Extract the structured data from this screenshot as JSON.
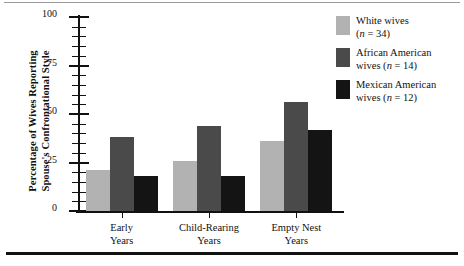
{
  "chart_data": {
    "type": "bar",
    "title": "",
    "xlabel": "",
    "ylabel": "Percentage of Wives Reporting Spouse's Confrontational Style",
    "ylabel_line1": "Percentage of Wives Reporting",
    "ylabel_line2": "Spouse's Confrontational Style",
    "ylim": [
      0,
      100
    ],
    "ytick_labels": [
      "0",
      "25",
      "50",
      "75",
      "100"
    ],
    "ytick_values": [
      0,
      25,
      50,
      75,
      100
    ],
    "yminor_step": 5,
    "grid": false,
    "legend_position": "top-right",
    "categories": [
      "Early Years",
      "Child-Rearing Years",
      "Empty Nest Years"
    ],
    "category_lines": [
      [
        "Early",
        "Years"
      ],
      [
        "Child-Rearing",
        "Years"
      ],
      [
        "Empty Nest",
        "Years"
      ]
    ],
    "series": [
      {
        "name": "White wives (n = 34)",
        "legend_line1": "White wives",
        "legend_line2": "(n = 34)",
        "n": 34,
        "color": "#b2b2b2",
        "values": [
          21,
          26,
          36
        ]
      },
      {
        "name": "African American wives (n = 14)",
        "legend_line1": "African American",
        "legend_line2": "wives (n = 14)",
        "n": 14,
        "color": "#4a4a4a",
        "values": [
          38,
          44,
          56
        ]
      },
      {
        "name": "Mexican American wives (n = 12)",
        "legend_line1": "Mexican American",
        "legend_line2": "wives (n =  12)",
        "n": 12,
        "color": "#141414",
        "values": [
          18,
          18,
          42
        ]
      }
    ]
  },
  "colors": {
    "axis": "#111111",
    "rule_top": "#9a9a9a",
    "rule_bottom": "#111111",
    "background": "#ffffff"
  }
}
